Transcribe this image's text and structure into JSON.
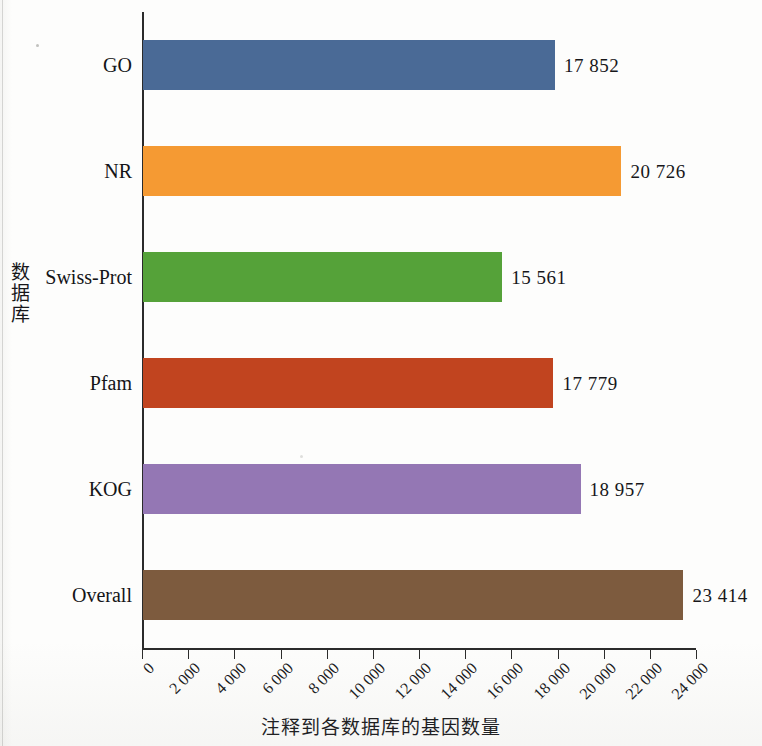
{
  "chart_data": {
    "type": "bar",
    "orientation": "horizontal",
    "title": "",
    "xlabel": "注释到各数据库的基因数量",
    "ylabel": "数据库",
    "categories": [
      "GO",
      "NR",
      "Swiss-Prot",
      "Pfam",
      "KOG",
      "Overall"
    ],
    "values": [
      17852,
      20726,
      15561,
      17779,
      18957,
      23414
    ],
    "value_labels": [
      "17 852",
      "20 726",
      "15 561",
      "17 779",
      "18 957",
      "23 414"
    ],
    "colors": [
      "#4a6a96",
      "#f59a33",
      "#55a239",
      "#c1441f",
      "#9477b4",
      "#7d5b3e"
    ],
    "xlim": [
      0,
      24000
    ],
    "xticks": [
      0,
      2000,
      4000,
      6000,
      8000,
      10000,
      12000,
      14000,
      16000,
      18000,
      20000,
      22000,
      24000
    ],
    "xtick_labels": [
      "0",
      "2 000",
      "4 000",
      "6 000",
      "8 000",
      "10 000",
      "12 000",
      "14 000",
      "16 000",
      "18 000",
      "20 000",
      "22 000",
      "24 000"
    ],
    "xtick_label_rotation": -45,
    "grid": false,
    "legend": false,
    "bars": [
      {
        "category": "GO",
        "value": 17852,
        "label": "17 852",
        "color": "#4a6a96"
      },
      {
        "category": "NR",
        "value": 20726,
        "label": "20 726",
        "color": "#f59a33"
      },
      {
        "category": "Swiss-Prot",
        "value": 15561,
        "label": "15 561",
        "color": "#55a239"
      },
      {
        "category": "Pfam",
        "value": 17779,
        "label": "17 779",
        "color": "#c1441f"
      },
      {
        "category": "KOG",
        "value": 18957,
        "label": "18 957",
        "color": "#9477b4"
      },
      {
        "category": "Overall",
        "value": 23414,
        "label": "23 414",
        "color": "#7d5b3e"
      }
    ]
  }
}
